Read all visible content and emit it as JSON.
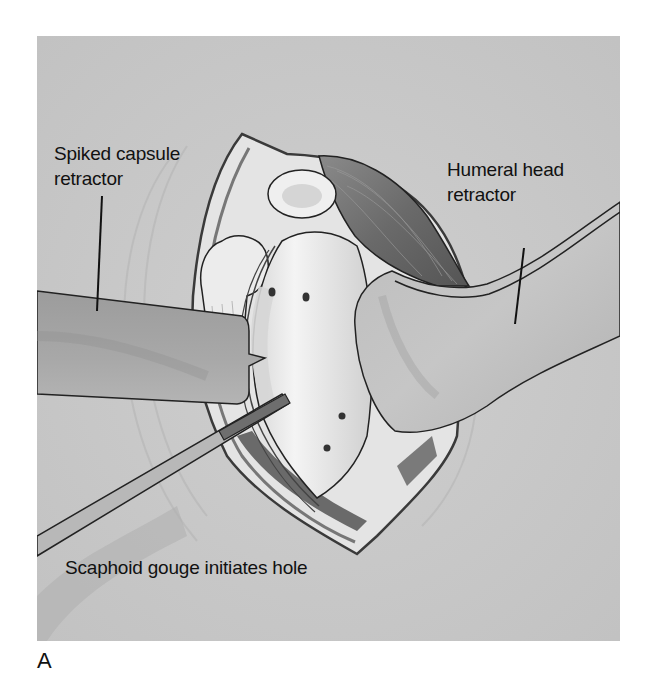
{
  "figure": {
    "panel_letter": "A",
    "background_color": "#c9c9c9",
    "labels": {
      "spiked_capsule_retractor": [
        "Spiked capsule",
        "retractor"
      ],
      "humeral_head_retractor": [
        "Humeral head",
        "retractor"
      ],
      "scaphoid_gouge": "Scaphoid gouge initiates hole"
    },
    "elements": [
      "spiked-capsule-retractor",
      "humeral-head-retractor",
      "scaphoid-gouge",
      "glenoid-surface",
      "incision-wound",
      "muscle-belly",
      "coracoid-process",
      "drill-holes"
    ]
  }
}
